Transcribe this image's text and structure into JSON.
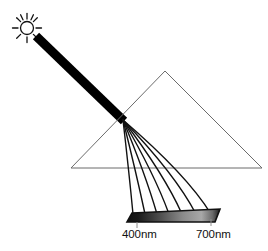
{
  "figure": {
    "background_color": "#ffffff",
    "width": 268,
    "height": 251
  },
  "sun": {
    "icon": "sun-icon",
    "center_x": 27,
    "center_y": 28,
    "core_radius": 6.5,
    "ray_count": 10,
    "ray_inner": 9,
    "ray_outer": 14,
    "stroke_color": "#111111",
    "stroke_width": 1.3
  },
  "incident_beam": {
    "label": "white-light-beam",
    "color": "#000000",
    "start_x": 36,
    "start_y": 36,
    "end_x": 124,
    "end_y": 121,
    "thickness": 9
  },
  "prism": {
    "label": "triangular-prism",
    "apex_x": 165,
    "apex_y": 71,
    "left_x": 71,
    "left_y": 168,
    "right_x": 262,
    "right_y": 168,
    "stroke_color": "#6b6b6b",
    "stroke_width": 1
  },
  "dispersion": {
    "label": "refracted-ray-fan",
    "origin_x": 123,
    "origin_y": 120,
    "stroke_color": "#111111",
    "stroke_width": 1.4,
    "ray_count": 7,
    "rays": [
      {
        "name": "ray-400nm",
        "wavelength": 400,
        "end_x": 133,
        "end_y": 214,
        "mid_x": 129,
        "mid_y": 172
      },
      {
        "name": "ray-450nm",
        "wavelength": 450,
        "end_x": 145,
        "end_y": 214,
        "mid_x": 136,
        "mid_y": 172
      },
      {
        "name": "ray-500nm",
        "wavelength": 500,
        "end_x": 157,
        "end_y": 214,
        "mid_x": 145,
        "mid_y": 173
      },
      {
        "name": "ray-550nm",
        "wavelength": 550,
        "end_x": 169,
        "end_y": 214,
        "mid_x": 154,
        "mid_y": 173
      },
      {
        "name": "ray-600nm",
        "wavelength": 600,
        "end_x": 182,
        "end_y": 214,
        "mid_x": 164,
        "mid_y": 174
      },
      {
        "name": "ray-650nm",
        "wavelength": 650,
        "end_x": 196,
        "end_y": 214,
        "mid_x": 175,
        "mid_y": 174
      },
      {
        "name": "ray-700nm",
        "wavelength": 700,
        "end_x": 211,
        "end_y": 214,
        "mid_x": 187,
        "mid_y": 175
      }
    ]
  },
  "spectrum_bar": {
    "label": "spectrum-strip",
    "x": 127,
    "y": 213,
    "width": 88,
    "height": 9,
    "skew_offset": 5,
    "border_color": "#111111",
    "border_width": 1.4,
    "gradient_stops": [
      {
        "offset": "0%",
        "color": "#111111"
      },
      {
        "offset": "12%",
        "color": "#1a1a1a"
      },
      {
        "offset": "35%",
        "color": "#4d4d4d"
      },
      {
        "offset": "60%",
        "color": "#8a8a8a"
      },
      {
        "offset": "80%",
        "color": "#a8a8a8"
      },
      {
        "offset": "92%",
        "color": "#6a6a6a"
      },
      {
        "offset": "100%",
        "color": "#1a1a1a"
      }
    ]
  },
  "labels": {
    "left": {
      "name": "wavelength-label-400",
      "text": "400nm",
      "x": 122,
      "y": 238,
      "tick_x": 137,
      "tick_y1": 222,
      "tick_y2": 228
    },
    "right": {
      "name": "wavelength-label-700",
      "text": "700nm",
      "x": 196,
      "y": 238,
      "tick_x": 211,
      "tick_y1": 219,
      "tick_y2": 226
    },
    "text_color": "#111111"
  }
}
